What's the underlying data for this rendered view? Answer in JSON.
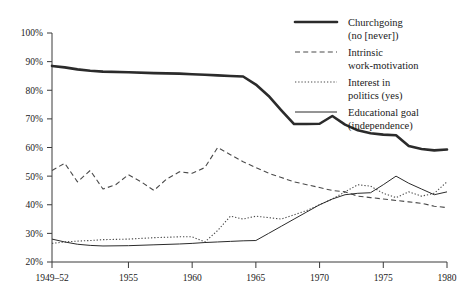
{
  "chart_data": {
    "type": "line",
    "title": "",
    "subtitle": "",
    "xlabel": "",
    "ylabel": "",
    "grid": false,
    "legend_position": "top-right",
    "xlim": [
      1949,
      1980
    ],
    "ylim": [
      20,
      100
    ],
    "y_ticks": [
      20,
      30,
      40,
      50,
      60,
      70,
      80,
      90,
      100
    ],
    "y_tick_labels": [
      "20%",
      "30%",
      "40%",
      "50%",
      "60%",
      "70%",
      "80%",
      "90%",
      "100%"
    ],
    "x_ticks": [
      1949,
      1955,
      1960,
      1965,
      1970,
      1975,
      1980
    ],
    "x_tick_labels": [
      "1949–52",
      "1955",
      "1960",
      "1965",
      "1970",
      "1975",
      "1980"
    ],
    "series": [
      {
        "name": "Churchgoing (no [never])",
        "legend_label_line1": "Churchgoing",
        "legend_label_line2": "(no [never])",
        "style": "solid-thick",
        "color": "#2b2b2b",
        "points": [
          [
            1949,
            88.5
          ],
          [
            1950,
            88.0
          ],
          [
            1951,
            87.3
          ],
          [
            1952,
            86.8
          ],
          [
            1953,
            86.5
          ],
          [
            1955,
            86.3
          ],
          [
            1957,
            86.0
          ],
          [
            1959,
            85.8
          ],
          [
            1960,
            85.6
          ],
          [
            1961,
            85.4
          ],
          [
            1962,
            85.2
          ],
          [
            1963,
            85.0
          ],
          [
            1964,
            84.8
          ],
          [
            1965,
            82.0
          ],
          [
            1966,
            78.0
          ],
          [
            1967,
            73.0
          ],
          [
            1968,
            68.2
          ],
          [
            1969,
            68.2
          ],
          [
            1970,
            68.3
          ],
          [
            1971,
            71.0
          ],
          [
            1972,
            68.0
          ],
          [
            1973,
            66.0
          ],
          [
            1974,
            65.0
          ],
          [
            1975,
            64.5
          ],
          [
            1976,
            64.3
          ],
          [
            1977,
            60.5
          ],
          [
            1978,
            59.5
          ],
          [
            1979,
            59.0
          ],
          [
            1980,
            59.3
          ]
        ]
      },
      {
        "name": "Intrinsic work-motivation",
        "legend_label_line1": "Intrinsic",
        "legend_label_line2": "work-motivation",
        "style": "dashed",
        "color": "#4a4a4a",
        "points": [
          [
            1949,
            52.0
          ],
          [
            1950,
            54.5
          ],
          [
            1951,
            48.0
          ],
          [
            1952,
            52.0
          ],
          [
            1953,
            45.5
          ],
          [
            1954,
            47.0
          ],
          [
            1955,
            50.5
          ],
          [
            1956,
            48.0
          ],
          [
            1957,
            45.0
          ],
          [
            1958,
            49.0
          ],
          [
            1959,
            51.5
          ],
          [
            1960,
            51.0
          ],
          [
            1961,
            53.0
          ],
          [
            1962,
            60.0
          ],
          [
            1963,
            57.5
          ],
          [
            1964,
            55.0
          ],
          [
            1965,
            53.0
          ],
          [
            1966,
            51.0
          ],
          [
            1967,
            49.5
          ],
          [
            1968,
            48.0
          ],
          [
            1969,
            47.0
          ],
          [
            1970,
            46.0
          ],
          [
            1971,
            45.0
          ],
          [
            1972,
            44.5
          ],
          [
            1973,
            43.0
          ],
          [
            1974,
            42.5
          ],
          [
            1975,
            42.0
          ],
          [
            1976,
            41.5
          ],
          [
            1977,
            41.0
          ],
          [
            1978,
            40.5
          ],
          [
            1979,
            39.5
          ],
          [
            1980,
            39.0
          ]
        ]
      },
      {
        "name": "Interest in politics (yes)",
        "legend_label_line1": "Interest in",
        "legend_label_line2": "politics (yes)",
        "style": "dotted",
        "color": "#4a4a4a",
        "points": [
          [
            1949,
            26.5
          ],
          [
            1950,
            27.0
          ],
          [
            1951,
            27.3
          ],
          [
            1952,
            27.5
          ],
          [
            1953,
            27.8
          ],
          [
            1955,
            28.0
          ],
          [
            1957,
            28.5
          ],
          [
            1959,
            28.8
          ],
          [
            1960,
            28.8
          ],
          [
            1961,
            27.0
          ],
          [
            1962,
            31.0
          ],
          [
            1963,
            36.0
          ],
          [
            1964,
            35.0
          ],
          [
            1965,
            36.0
          ],
          [
            1966,
            35.5
          ],
          [
            1967,
            35.0
          ],
          [
            1968,
            36.5
          ],
          [
            1969,
            38.0
          ],
          [
            1970,
            40.0
          ],
          [
            1971,
            42.0
          ],
          [
            1972,
            44.5
          ],
          [
            1973,
            47.0
          ],
          [
            1974,
            46.5
          ],
          [
            1975,
            44.0
          ],
          [
            1976,
            42.5
          ],
          [
            1977,
            44.5
          ],
          [
            1978,
            43.0
          ],
          [
            1979,
            44.0
          ],
          [
            1980,
            48.0
          ]
        ]
      },
      {
        "name": "Educational goal (independence)",
        "legend_label_line1": "Educational goal",
        "legend_label_line2": "(independence)",
        "style": "solid-thin",
        "color": "#2b2b2b",
        "points": [
          [
            1949,
            28.0
          ],
          [
            1950,
            27.0
          ],
          [
            1951,
            26.2
          ],
          [
            1952,
            25.8
          ],
          [
            1953,
            25.6
          ],
          [
            1955,
            25.7
          ],
          [
            1957,
            26.0
          ],
          [
            1959,
            26.3
          ],
          [
            1960,
            26.5
          ],
          [
            1961,
            26.8
          ],
          [
            1962,
            27.0
          ],
          [
            1963,
            27.2
          ],
          [
            1964,
            27.4
          ],
          [
            1965,
            27.5
          ],
          [
            1966,
            30.0
          ],
          [
            1967,
            32.5
          ],
          [
            1968,
            35.0
          ],
          [
            1969,
            37.5
          ],
          [
            1970,
            40.0
          ],
          [
            1971,
            42.0
          ],
          [
            1972,
            43.5
          ],
          [
            1973,
            44.0
          ],
          [
            1974,
            44.2
          ],
          [
            1975,
            47.0
          ],
          [
            1976,
            50.0
          ],
          [
            1977,
            47.5
          ],
          [
            1978,
            45.5
          ],
          [
            1979,
            43.5
          ],
          [
            1980,
            44.5
          ]
        ]
      }
    ]
  },
  "legend": {
    "items": [
      {
        "key": "churchgoing",
        "line1": "Churchgoing",
        "line2": "(no [never])",
        "style": "solid-thick"
      },
      {
        "key": "intrinsic-work-motivation",
        "line1": "Intrinsic",
        "line2": "work-motivation",
        "style": "dashed"
      },
      {
        "key": "interest-in-politics",
        "line1": "Interest in",
        "line2": "politics (yes)",
        "style": "dotted"
      },
      {
        "key": "educational-goal",
        "line1": "Educational goal",
        "line2": "(independence)",
        "style": "solid-thin"
      }
    ]
  },
  "axes": {
    "y_labels": [
      "100%",
      "90%",
      "80%",
      "70%",
      "60%",
      "50%",
      "40%",
      "30%",
      "20%"
    ],
    "x_labels": [
      "1949–52",
      "1955",
      "1960",
      "1965",
      "1970",
      "1975",
      "1980"
    ]
  }
}
